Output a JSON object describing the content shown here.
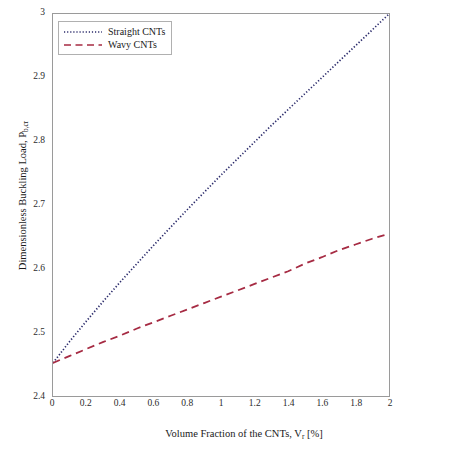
{
  "chart_data": {
    "type": "line",
    "title": "",
    "xlabel": "Volume Fraction of the CNTs, V",
    "xlabel_sub": "r",
    "xlabel_suffix": " [%]",
    "ylabel": "Dimensionless Buckling Load, P",
    "ylabel_sub": "b,cr",
    "xlim": [
      0,
      2
    ],
    "ylim": [
      2.4,
      3
    ],
    "xticks": [
      "0",
      "0.2",
      "0.4",
      "0.6",
      "0.8",
      "1",
      "1.2",
      "1.4",
      "1.6",
      "1.8",
      "2"
    ],
    "xtick_values": [
      0,
      0.2,
      0.4,
      0.6,
      0.8,
      1,
      1.2,
      1.4,
      1.6,
      1.8,
      2
    ],
    "yticks": [
      "2.4",
      "2.5",
      "2.6",
      "2.7",
      "2.8",
      "2.9",
      "3"
    ],
    "ytick_values": [
      2.4,
      2.5,
      2.6,
      2.7,
      2.8,
      2.9,
      3
    ],
    "grid": false,
    "legend_position": "top-left",
    "series": [
      {
        "name": "Straight CNTs",
        "color": "#2b2b6b",
        "linestyle": "dotted",
        "x": [
          0,
          0.1,
          0.2,
          0.3,
          0.4,
          0.5,
          0.6,
          0.7,
          0.8,
          0.9,
          1.0,
          1.1,
          1.2,
          1.3,
          1.4,
          1.5,
          1.6,
          1.7,
          1.8,
          1.9,
          2.0
        ],
        "values": [
          2.452,
          2.486,
          2.518,
          2.549,
          2.579,
          2.608,
          2.637,
          2.665,
          2.693,
          2.72,
          2.747,
          2.773,
          2.799,
          2.825,
          2.85,
          2.875,
          2.9,
          2.925,
          2.95,
          2.975,
          3.0
        ]
      },
      {
        "name": "Wavy CNTs",
        "color": "#a62b43",
        "linestyle": "dashed",
        "x": [
          0,
          0.1,
          0.2,
          0.3,
          0.4,
          0.5,
          0.6,
          0.7,
          0.8,
          0.9,
          1.0,
          1.1,
          1.2,
          1.3,
          1.4,
          1.5,
          1.6,
          1.7,
          1.8,
          1.9,
          2.0
        ],
        "values": [
          2.452,
          2.463,
          2.474,
          2.485,
          2.495,
          2.506,
          2.516,
          2.526,
          2.536,
          2.546,
          2.556,
          2.566,
          2.576,
          2.586,
          2.596,
          2.608,
          2.618,
          2.629,
          2.638,
          2.647,
          2.655
        ]
      }
    ]
  },
  "legend": {
    "items": [
      {
        "label": "Straight CNTs"
      },
      {
        "label": "Wavy CNTs"
      }
    ]
  }
}
